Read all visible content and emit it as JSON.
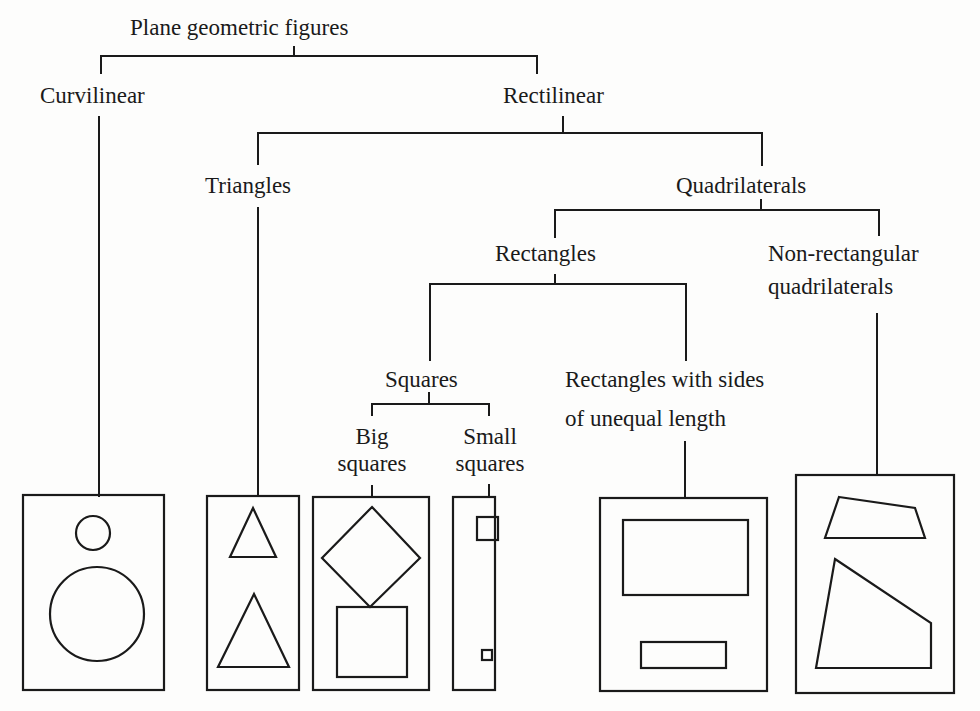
{
  "title": "Plane geometric figures",
  "nodes": {
    "root": "Plane geometric figures",
    "curvilinear": "Curvilinear",
    "rectilinear": "Rectilinear",
    "triangles": "Triangles",
    "quadrilaterals": "Quadrilaterals",
    "rectangles": "Rectangles",
    "non_rectangular": {
      "line1": "Non-rectangular",
      "line2": "quadrilaterals"
    },
    "squares": "Squares",
    "unequal_rectangles": {
      "line1": "Rectangles with sides",
      "line2": "of unequal length"
    },
    "big_squares": {
      "line1": "Big",
      "line2": "squares"
    },
    "small_squares": {
      "line1": "Small",
      "line2": "squares"
    }
  },
  "leaf_panels": [
    {
      "id": "curvilinear",
      "shapes": [
        "small circle",
        "large circle"
      ]
    },
    {
      "id": "triangles",
      "shapes": [
        "small triangle",
        "large triangle"
      ]
    },
    {
      "id": "big_squares",
      "shapes": [
        "rotated square (diamond)",
        "square"
      ]
    },
    {
      "id": "small_squares",
      "shapes": [
        "small square",
        "tiny square"
      ]
    },
    {
      "id": "unequal_rectangles",
      "shapes": [
        "wide rectangle",
        "thin rectangle"
      ]
    },
    {
      "id": "non_rectangular",
      "shapes": [
        "trapezoid",
        "irregular quadrilateral"
      ]
    }
  ],
  "colors": {
    "ink": "#1a1a1a",
    "paper": "#fdfdfc"
  }
}
